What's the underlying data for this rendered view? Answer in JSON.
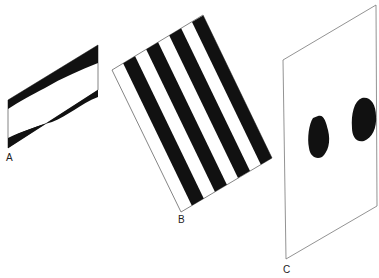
{
  "figure": {
    "panels": [
      {
        "id": "A",
        "label": "A",
        "description": "Parallelogram with wavy black bands along top and bottom edges"
      },
      {
        "id": "B",
        "label": "B",
        "description": "Tilted rectangle with alternating black and white diagonal stripes"
      },
      {
        "id": "C",
        "label": "C",
        "description": "Tilted outlined panel containing two black irregular blobs"
      }
    ],
    "colors": {
      "ink": "#111111",
      "outline": "#555555",
      "background": "#ffffff"
    }
  }
}
